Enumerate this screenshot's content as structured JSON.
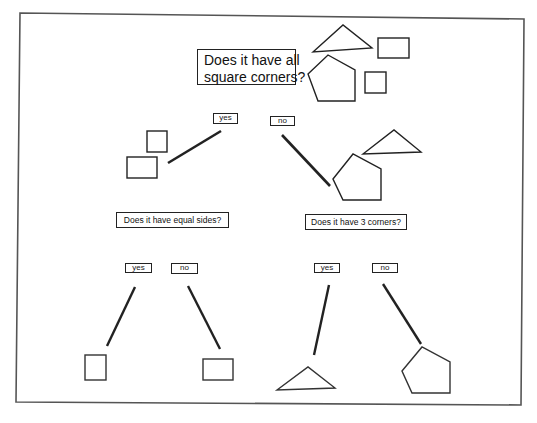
{
  "diagram": {
    "type": "decision-tree",
    "colors": {
      "ink": "#222222",
      "frame": "#555555",
      "background": "#ffffff"
    },
    "root": {
      "question": "Does it have all square corners?",
      "question_lines": [
        "Does it have all",
        "square corners?"
      ],
      "shapes": [
        "triangle",
        "rectangle",
        "pentagon",
        "square"
      ],
      "yes_label": "yes",
      "no_label": "no"
    },
    "yes_branch": {
      "shapes": [
        "square",
        "rectangle"
      ],
      "question": "Does it have equal sides?",
      "yes_label": "yes",
      "no_label": "no",
      "yes_result": "square",
      "no_result": "rectangle"
    },
    "no_branch": {
      "shapes": [
        "triangle",
        "pentagon"
      ],
      "question": "Does it have 3 corners?",
      "yes_label": "yes",
      "no_label": "no",
      "yes_result": "triangle",
      "no_result": "pentagon"
    }
  }
}
